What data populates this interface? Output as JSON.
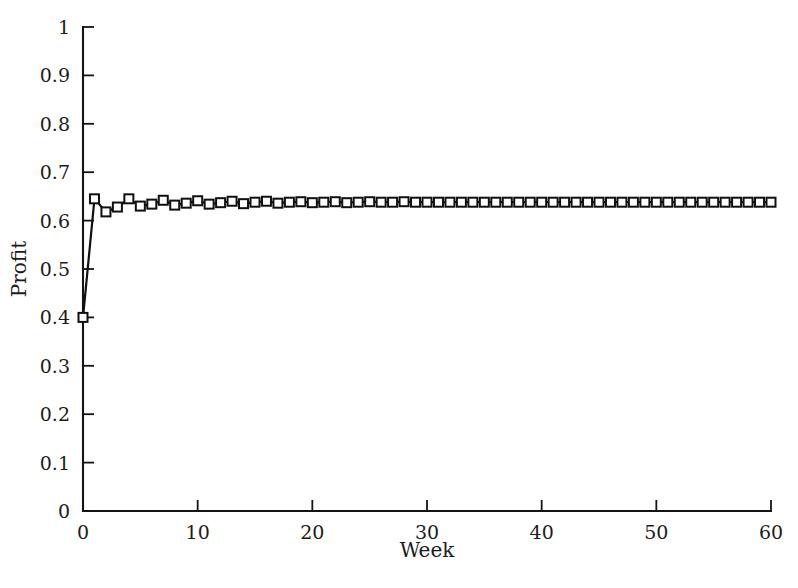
{
  "chart_data": {
    "type": "line",
    "title": "",
    "subtitle": "",
    "xlabel": "Week",
    "ylabel": "Profit",
    "xlim": [
      0,
      60
    ],
    "ylim": [
      0,
      1
    ],
    "grid": false,
    "legend": null,
    "legend_position": "none",
    "marker": "open-square",
    "line_color": "#101010",
    "marker_face_color": "#ffffff",
    "marker_edge_color": "#101010",
    "xticks": [
      0,
      10,
      20,
      30,
      40,
      50,
      60
    ],
    "xtick_labels": [
      "0",
      "10",
      "20",
      "30",
      "40",
      "50",
      "60"
    ],
    "yticks": [
      0,
      0.1,
      0.2,
      0.3,
      0.4,
      0.5,
      0.6,
      0.7,
      0.8,
      0.9,
      1
    ],
    "ytick_labels": [
      "0",
      "0.1",
      "0.2",
      "0.3",
      "0.4",
      "0.5",
      "0.6",
      "0.7",
      "0.8",
      "0.9",
      "1"
    ],
    "series": [
      {
        "name": "Profit",
        "x": [
          0,
          1,
          2,
          3,
          4,
          5,
          6,
          7,
          8,
          9,
          10,
          11,
          12,
          13,
          14,
          15,
          16,
          17,
          18,
          19,
          20,
          21,
          22,
          23,
          24,
          25,
          26,
          27,
          28,
          29,
          30,
          31,
          32,
          33,
          34,
          35,
          36,
          37,
          38,
          39,
          40,
          41,
          42,
          43,
          44,
          45,
          46,
          47,
          48,
          49,
          50,
          51,
          52,
          53,
          54,
          55,
          56,
          57,
          58,
          59,
          60
        ],
        "values": [
          0.4,
          0.645,
          0.618,
          0.628,
          0.645,
          0.63,
          0.634,
          0.642,
          0.632,
          0.636,
          0.641,
          0.634,
          0.637,
          0.64,
          0.635,
          0.638,
          0.64,
          0.636,
          0.638,
          0.639,
          0.637,
          0.638,
          0.639,
          0.637,
          0.638,
          0.639,
          0.638,
          0.638,
          0.639,
          0.638,
          0.638,
          0.638,
          0.638,
          0.638,
          0.638,
          0.638,
          0.638,
          0.638,
          0.638,
          0.638,
          0.638,
          0.638,
          0.638,
          0.638,
          0.638,
          0.638,
          0.638,
          0.638,
          0.638,
          0.638,
          0.638,
          0.638,
          0.638,
          0.638,
          0.638,
          0.638,
          0.638,
          0.638,
          0.638,
          0.638,
          0.638
        ]
      }
    ],
    "annotations": []
  },
  "axes": {
    "x_title": "Week",
    "y_title": "Profit"
  }
}
